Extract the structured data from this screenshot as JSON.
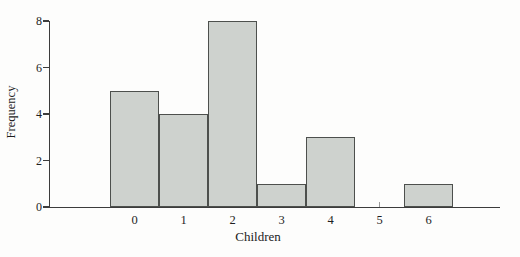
{
  "chart_data": {
    "type": "bar",
    "categories": [
      "0",
      "1",
      "2",
      "3",
      "4",
      "5",
      "6"
    ],
    "values": [
      5,
      4,
      8,
      1,
      3,
      0,
      1
    ],
    "title": "",
    "xlabel": "Children",
    "ylabel": "Frequency",
    "ylim": [
      0,
      8
    ],
    "yticks": [
      0,
      2,
      4,
      6,
      8
    ],
    "grid": false,
    "legend": "none",
    "colors": {
      "bar_fill": "#ced2ce",
      "bar_stroke": "#4d504d",
      "axis": "#3c3c3c",
      "text": "#1f1f1f",
      "background": "#fdfdfc"
    }
  }
}
